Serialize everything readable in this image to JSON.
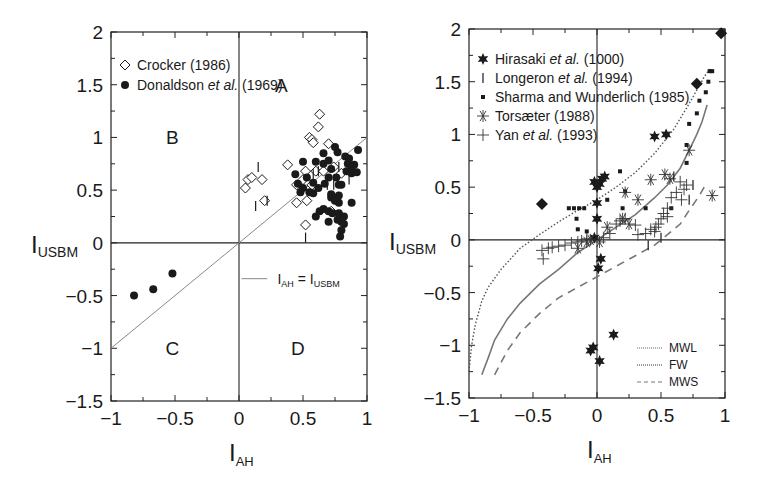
{
  "chart_data": [
    {
      "id": "left",
      "type": "scatter",
      "title": "",
      "xlabel": "I",
      "xlabel_sub": "AH",
      "ylabel": "I",
      "ylabel_sub": "USBM",
      "xlim": [
        -1,
        1
      ],
      "ylim": [
        -1.5,
        2
      ],
      "xticks": [
        "-1",
        "-0.5",
        "0",
        "0.5",
        "1"
      ],
      "xtick_values": [
        -1,
        -0.5,
        0,
        0.5,
        1
      ],
      "yticks": [
        "2",
        "1.5",
        "1",
        "0.5",
        "0",
        "-0.5",
        "-1",
        "-1.5"
      ],
      "ytick_values": [
        2,
        1.5,
        1,
        0.5,
        0,
        -0.5,
        -1,
        -1.5
      ],
      "grid": false,
      "frame_px": {
        "left": 111,
        "top": 32,
        "right": 367,
        "bottom": 401
      },
      "quadrant_labels": [
        {
          "text": "A",
          "x": 0.33,
          "y": 1.5
        },
        {
          "text": "B",
          "x": -0.52,
          "y": 1.0
        },
        {
          "text": "C",
          "x": -0.52,
          "y": -1.0
        },
        {
          "text": "D",
          "x": 0.46,
          "y": -1.0
        }
      ],
      "legend": {
        "position": "upper-left",
        "entries": [
          {
            "marker": "open-diamond",
            "label": "Crocker (1986)"
          },
          {
            "marker": "filled-circle",
            "label_pre": "Donaldson ",
            "label_italic": "et al.",
            "label_post": " (1969)"
          }
        ]
      },
      "line_legend": {
        "label": "I_AH = I_USBM",
        "label_main_1": "I",
        "label_sub_1": "AH",
        "label_mid": " = I",
        "label_sub_2": "USBM"
      },
      "lines": [
        {
          "name": "I_AH = I_USBM",
          "style": "solid-thin",
          "color": "#888888",
          "x": [
            -1,
            1
          ],
          "y": [
            -1,
            1
          ]
        }
      ],
      "series": [
        {
          "name": "Crocker (1986)",
          "marker": "open-diamond",
          "points": [
            [
              0.05,
              0.52
            ],
            [
              0.07,
              0.6
            ],
            [
              0.1,
              0.62
            ],
            [
              0.18,
              0.6
            ],
            [
              0.2,
              0.4
            ],
            [
              0.38,
              0.74
            ],
            [
              0.45,
              0.55
            ],
            [
              0.45,
              0.38
            ],
            [
              0.5,
              0.6
            ],
            [
              0.52,
              0.68
            ],
            [
              0.53,
              0.4
            ],
            [
              0.52,
              0.17
            ],
            [
              0.55,
              1.0
            ],
            [
              0.57,
              0.98
            ],
            [
              0.58,
              0.95
            ],
            [
              0.62,
              1.1
            ],
            [
              0.63,
              1.22
            ],
            [
              0.6,
              0.68
            ],
            [
              0.66,
              0.68
            ],
            [
              0.7,
              0.94
            ],
            [
              0.74,
              0.72
            ],
            [
              0.72,
              0.3
            ],
            [
              0.8,
              0.66
            ],
            [
              0.57,
              0.55
            ]
          ]
        },
        {
          "name": "Donaldson et al. (1969)",
          "marker": "filled-circle",
          "points": [
            [
              -0.82,
              -0.5
            ],
            [
              -0.67,
              -0.44
            ],
            [
              -0.52,
              -0.29
            ],
            [
              0.44,
              0.65
            ],
            [
              0.5,
              0.52
            ],
            [
              0.5,
              0.77
            ],
            [
              0.53,
              0.62
            ],
            [
              0.55,
              0.48
            ],
            [
              0.6,
              0.77
            ],
            [
              0.62,
              0.52
            ],
            [
              0.58,
              0.47
            ],
            [
              0.63,
              0.3
            ],
            [
              0.66,
              0.32
            ],
            [
              0.7,
              0.3
            ],
            [
              0.67,
              0.56
            ],
            [
              0.72,
              0.43
            ],
            [
              0.72,
              0.46
            ],
            [
              0.7,
              0.62
            ],
            [
              0.66,
              0.75
            ],
            [
              0.66,
              0.85
            ],
            [
              0.7,
              0.78
            ],
            [
              0.72,
              0.7
            ],
            [
              0.75,
              0.91
            ],
            [
              0.77,
              0.86
            ],
            [
              0.76,
              0.62
            ],
            [
              0.78,
              0.55
            ],
            [
              0.8,
              0.55
            ],
            [
              0.78,
              0.45
            ],
            [
              0.78,
              0.38
            ],
            [
              0.75,
              0.4
            ],
            [
              0.73,
              0.28
            ],
            [
              0.77,
              0.22
            ],
            [
              0.8,
              0.2
            ],
            [
              0.78,
              0.28
            ],
            [
              0.83,
              0.82
            ],
            [
              0.85,
              0.75
            ],
            [
              0.84,
              0.68
            ],
            [
              0.86,
              0.8
            ],
            [
              0.88,
              0.66
            ],
            [
              0.88,
              0.72
            ],
            [
              0.9,
              0.74
            ],
            [
              0.93,
              0.88
            ],
            [
              0.88,
              0.38
            ],
            [
              0.92,
              0.67
            ],
            [
              0.82,
              0.25
            ],
            [
              0.82,
              0.18
            ],
            [
              0.8,
              0.12
            ],
            [
              0.79,
              0.06
            ],
            [
              0.7,
              0.2
            ],
            [
              0.58,
              0.57
            ],
            [
              0.48,
              0.48
            ],
            [
              0.46,
              0.56
            ],
            [
              0.6,
              0.25
            ]
          ]
        },
        {
          "name": "I-bar markers (unlabelled)",
          "marker": "vbar",
          "points": [
            [
              0.15,
              0.72
            ],
            [
              0.13,
              0.35
            ],
            [
              0.22,
              0.4
            ],
            [
              0.52,
              0.05
            ],
            [
              0.69,
              0.55
            ],
            [
              0.74,
              0.55
            ],
            [
              0.78,
              0.72
            ],
            [
              0.86,
              0.6
            ],
            [
              0.58,
              0.65
            ],
            [
              0.62,
              0.68
            ]
          ]
        }
      ]
    },
    {
      "id": "right",
      "type": "scatter",
      "title": "",
      "xlabel": "I",
      "xlabel_sub": "AH",
      "ylabel": "I",
      "ylabel_sub": "USBM",
      "xlim": [
        -1,
        1
      ],
      "ylim": [
        -1.5,
        2
      ],
      "xticks": [
        "-1",
        "-0.5",
        "0",
        "0.5",
        "1"
      ],
      "xtick_values": [
        -1,
        -0.5,
        0,
        0.5,
        1
      ],
      "yticks": [
        "2",
        "1.5",
        "1",
        "0.5",
        "0",
        "-0.5",
        "-1",
        "-1.5"
      ],
      "ytick_values": [
        2,
        1.5,
        1,
        0.5,
        0,
        -0.5,
        -1,
        -1.5
      ],
      "grid": false,
      "frame_px": {
        "left": 469,
        "top": 29,
        "right": 725,
        "bottom": 398
      },
      "legend": {
        "position": "upper-left",
        "entries": [
          {
            "marker": "filled-star",
            "label_pre": "Hirasaki ",
            "label_italic": "et al.",
            "label_post": " (1000)"
          },
          {
            "marker": "vbar",
            "label_pre": "Longeron ",
            "label_italic": "et al.",
            "label_post": " (1994)"
          },
          {
            "marker": "filled-square",
            "label_pre": "Sharma and Wunderlich (1985)",
            "label_italic": "",
            "label_post": ""
          },
          {
            "marker": "asterisk",
            "label_pre": "Torsæter (1988)",
            "label_italic": "",
            "label_post": ""
          },
          {
            "marker": "plus",
            "label_pre": "Yan ",
            "label_italic": "et al.",
            "label_post": " (1993)"
          }
        ]
      },
      "curve_legend": {
        "position": "lower-right",
        "entries": [
          {
            "label": "MWL",
            "style": "dotted-light"
          },
          {
            "label": "FW",
            "style": "dotted-dense"
          },
          {
            "label": "MWS",
            "style": "dashed"
          }
        ]
      },
      "curves": [
        {
          "name": "FW",
          "style": "dotted",
          "x": [
            -1.0,
            -0.98,
            -0.95,
            -0.9,
            -0.85,
            -0.75,
            -0.6,
            -0.45,
            -0.3,
            -0.15,
            0.0,
            0.15,
            0.3,
            0.45,
            0.6,
            0.7,
            0.78,
            0.84,
            0.88
          ],
          "y": [
            -1.25,
            -1.0,
            -0.8,
            -0.58,
            -0.45,
            -0.28,
            -0.08,
            0.05,
            0.17,
            0.28,
            0.38,
            0.5,
            0.64,
            0.82,
            1.05,
            1.25,
            1.42,
            1.55,
            1.62
          ]
        },
        {
          "name": "MWL",
          "style": "solid",
          "x": [
            -0.9,
            -0.85,
            -0.8,
            -0.7,
            -0.6,
            -0.45,
            -0.3,
            -0.15,
            0.0,
            0.15,
            0.3,
            0.45,
            0.55,
            0.65,
            0.72,
            0.78,
            0.82,
            0.86
          ],
          "y": [
            -1.28,
            -1.12,
            -0.95,
            -0.75,
            -0.6,
            -0.42,
            -0.28,
            -0.12,
            0.0,
            0.12,
            0.24,
            0.4,
            0.52,
            0.68,
            0.85,
            1.0,
            1.12,
            1.28
          ]
        },
        {
          "name": "MWS",
          "style": "dashed",
          "x": [
            -0.8,
            -0.7,
            -0.6,
            -0.45,
            -0.3,
            -0.15,
            0.0,
            0.15,
            0.3,
            0.45,
            0.55,
            0.65,
            0.72,
            0.8,
            0.86
          ],
          "y": [
            -1.28,
            -1.05,
            -0.88,
            -0.7,
            -0.55,
            -0.45,
            -0.35,
            -0.25,
            -0.15,
            -0.05,
            0.05,
            0.15,
            0.28,
            0.42,
            0.55
          ]
        }
      ],
      "series": [
        {
          "name": "Hirasaki et al. (1000)",
          "marker": "filled-star",
          "points": [
            [
              -0.02,
              0.55
            ],
            [
              0.0,
              0.5
            ],
            [
              0.02,
              0.53
            ],
            [
              0.04,
              0.58
            ],
            [
              0.06,
              0.6
            ],
            [
              0.0,
              0.35
            ],
            [
              0.0,
              0.2
            ],
            [
              0.45,
              0.98
            ],
            [
              0.54,
              1.0
            ],
            [
              0.03,
              -0.18
            ],
            [
              0.01,
              -0.27
            ],
            [
              -0.05,
              -1.05
            ],
            [
              -0.03,
              -1.02
            ],
            [
              0.02,
              -1.15
            ],
            [
              0.13,
              -0.9
            ],
            [
              -0.02,
              0.02
            ]
          ]
        },
        {
          "name": "Longeron et al. (1994)",
          "marker": "vbar",
          "points": [
            [
              0.75,
              0.52
            ],
            [
              0.72,
              0.38
            ],
            [
              0.5,
              0.02
            ],
            [
              0.4,
              -0.05
            ],
            [
              0.6,
              0.6
            ]
          ]
        },
        {
          "name": "Sharma and Wunderlich (1985)",
          "marker": "filled-square",
          "points": [
            [
              -0.22,
              0.3
            ],
            [
              -0.18,
              0.3
            ],
            [
              -0.14,
              0.3
            ],
            [
              -0.1,
              0.3
            ],
            [
              -0.16,
              0.2
            ],
            [
              -0.15,
              0.1
            ],
            [
              -0.08,
              0.08
            ],
            [
              0.08,
              0.38
            ],
            [
              0.18,
              0.65
            ],
            [
              0.22,
              0.46
            ],
            [
              0.2,
              0.3
            ],
            [
              0.38,
              0.3
            ],
            [
              0.58,
              0.3
            ],
            [
              0.7,
              0.73
            ],
            [
              0.7,
              0.9
            ],
            [
              0.72,
              1.1
            ],
            [
              0.78,
              1.2
            ],
            [
              0.8,
              1.32
            ],
            [
              0.85,
              1.4
            ],
            [
              0.87,
              1.5
            ],
            [
              0.88,
              1.6
            ],
            [
              0.9,
              1.6
            ]
          ]
        },
        {
          "name": "Diamond markers (unlabelled)",
          "marker": "filled-diamond",
          "points": [
            [
              -0.43,
              0.34
            ],
            [
              0.78,
              1.48
            ],
            [
              0.97,
              1.96
            ]
          ]
        },
        {
          "name": "Torsæter (1988)",
          "marker": "asterisk",
          "points": [
            [
              -0.05,
              0.0
            ],
            [
              0.02,
              -0.02
            ],
            [
              0.08,
              0.12
            ],
            [
              0.22,
              0.45
            ],
            [
              0.32,
              0.38
            ],
            [
              0.42,
              0.57
            ],
            [
              0.53,
              0.62
            ],
            [
              0.57,
              0.58
            ],
            [
              0.72,
              0.85
            ],
            [
              0.9,
              0.42
            ],
            [
              0.25,
              0.15
            ],
            [
              0.2,
              0.2
            ],
            [
              -0.15,
              -0.08
            ],
            [
              -0.08,
              -0.02
            ]
          ]
        },
        {
          "name": "Yan et al. (1993)",
          "marker": "plus",
          "points": [
            [
              -0.43,
              -0.1
            ],
            [
              -0.42,
              -0.18
            ],
            [
              -0.38,
              -0.08
            ],
            [
              -0.35,
              -0.07
            ],
            [
              -0.3,
              -0.06
            ],
            [
              -0.25,
              -0.05
            ],
            [
              -0.2,
              -0.03
            ],
            [
              -0.15,
              -0.02
            ],
            [
              -0.12,
              -0.01
            ],
            [
              -0.08,
              0.01
            ],
            [
              0.05,
              0.02
            ],
            [
              0.1,
              0.06
            ],
            [
              0.15,
              0.15
            ],
            [
              0.18,
              0.18
            ],
            [
              0.22,
              0.2
            ],
            [
              0.3,
              0.14
            ],
            [
              0.32,
              0.05
            ],
            [
              0.38,
              0.06
            ],
            [
              0.42,
              0.1
            ],
            [
              0.46,
              0.12
            ],
            [
              0.48,
              0.15
            ],
            [
              0.5,
              0.2
            ],
            [
              0.52,
              0.25
            ],
            [
              0.55,
              0.3
            ],
            [
              0.58,
              0.4
            ],
            [
              0.62,
              0.45
            ],
            [
              0.65,
              0.55
            ],
            [
              0.68,
              0.48
            ],
            [
              0.7,
              0.52
            ],
            [
              0.66,
              0.38
            ],
            [
              0.55,
              0.22
            ],
            [
              0.45,
              0.08
            ]
          ]
        }
      ]
    }
  ]
}
